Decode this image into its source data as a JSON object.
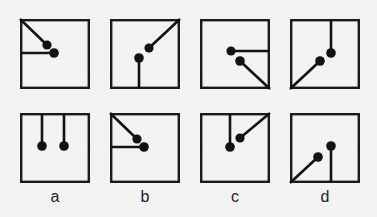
{
  "figure": {
    "title": "",
    "background_color": "#f4f3f1",
    "ink_color": "#121212",
    "columns": 4,
    "rows": 2,
    "cell_size_px": 70,
    "column_labels": [
      "a",
      "b",
      "c",
      "d"
    ]
  },
  "cells": [
    {
      "id": "top-a",
      "row": 0,
      "column": 0,
      "column_label": "a",
      "description": "diagonal from top-left corner to dot, plus horizontal from left edge to dot",
      "segments": [
        {
          "name": "diagonal-from-top-left-corner",
          "x1": 0,
          "y1": 0,
          "x2": 27,
          "y2": 26,
          "dot_x": 27,
          "dot_y": 26,
          "dot_r": 4.6
        },
        {
          "name": "horizontal-from-left-edge",
          "x1": 0,
          "y1": 34,
          "x2": 34,
          "y2": 34,
          "dot_x": 34,
          "dot_y": 34,
          "dot_r": 4.8
        }
      ]
    },
    {
      "id": "top-b",
      "row": 0,
      "column": 1,
      "column_label": "b",
      "description": "diagonal from top-right corner to dot, plus vertical from bottom edge to dot",
      "segments": [
        {
          "name": "diagonal-from-top-right-corner",
          "x1": 70,
          "y1": 0,
          "x2": 39,
          "y2": 29,
          "dot_x": 39,
          "dot_y": 29,
          "dot_r": 4.6
        },
        {
          "name": "vertical-from-bottom-edge",
          "x1": 29,
          "y1": 70,
          "x2": 29,
          "y2": 39,
          "dot_x": 29,
          "dot_y": 39,
          "dot_r": 4.8
        }
      ]
    },
    {
      "id": "top-c",
      "row": 0,
      "column": 2,
      "column_label": "c",
      "description": "horizontal from right edge to dot, plus diagonal from bottom-right corner to dot",
      "segments": [
        {
          "name": "horizontal-from-right-edge",
          "x1": 70,
          "y1": 32,
          "x2": 31,
          "y2": 32,
          "dot_x": 31,
          "dot_y": 32,
          "dot_r": 4.6
        },
        {
          "name": "diagonal-from-bottom-right-corner",
          "x1": 70,
          "y1": 70,
          "x2": 40,
          "y2": 42,
          "dot_x": 40,
          "dot_y": 42,
          "dot_r": 4.8
        }
      ]
    },
    {
      "id": "top-d",
      "row": 0,
      "column": 3,
      "column_label": "d",
      "description": "vertical from top edge to dot, plus diagonal from bottom-left corner to dot",
      "segments": [
        {
          "name": "vertical-from-top-edge",
          "x1": 41,
          "y1": 0,
          "x2": 41,
          "y2": 34,
          "dot_x": 41,
          "dot_y": 34,
          "dot_r": 4.8
        },
        {
          "name": "diagonal-from-bottom-left-corner",
          "x1": 0,
          "y1": 70,
          "x2": 30,
          "y2": 42,
          "dot_x": 30,
          "dot_y": 42,
          "dot_r": 4.8
        }
      ]
    },
    {
      "id": "bottom-a",
      "row": 1,
      "column": 0,
      "column_label": "a",
      "description": "two vertical lines from top edge, each ending in a dot",
      "segments": [
        {
          "name": "vertical-left-from-top-edge",
          "x1": 22,
          "y1": 0,
          "x2": 22,
          "y2": 33,
          "dot_x": 22,
          "dot_y": 33,
          "dot_r": 4.8
        },
        {
          "name": "vertical-right-from-top-edge",
          "x1": 44,
          "y1": 0,
          "x2": 44,
          "y2": 33,
          "dot_x": 44,
          "dot_y": 33,
          "dot_r": 4.8
        }
      ]
    },
    {
      "id": "bottom-b",
      "row": 1,
      "column": 1,
      "column_label": "b",
      "description": "diagonal from top-left corner to dot, plus horizontal from left edge to dot",
      "segments": [
        {
          "name": "diagonal-from-top-left-corner",
          "x1": 0,
          "y1": 0,
          "x2": 27,
          "y2": 26,
          "dot_x": 27,
          "dot_y": 26,
          "dot_r": 4.6
        },
        {
          "name": "horizontal-from-left-edge",
          "x1": 0,
          "y1": 34,
          "x2": 34,
          "y2": 34,
          "dot_x": 34,
          "dot_y": 34,
          "dot_r": 4.8
        }
      ]
    },
    {
      "id": "bottom-c",
      "row": 1,
      "column": 2,
      "column_label": "c",
      "description": "vertical from top edge to dot, plus diagonal from top-right corner to dot",
      "segments": [
        {
          "name": "vertical-from-top-edge",
          "x1": 30,
          "y1": 0,
          "x2": 30,
          "y2": 34,
          "dot_x": 30,
          "dot_y": 34,
          "dot_r": 4.8
        },
        {
          "name": "diagonal-from-top-right-corner",
          "x1": 70,
          "y1": 0,
          "x2": 40,
          "y2": 25,
          "dot_x": 40,
          "dot_y": 25,
          "dot_r": 4.6
        }
      ]
    },
    {
      "id": "bottom-d",
      "row": 1,
      "column": 3,
      "column_label": "d",
      "description": "diagonal from bottom-left corner to dot, plus vertical from bottom edge to dot",
      "segments": [
        {
          "name": "diagonal-from-bottom-left-corner",
          "x1": 0,
          "y1": 70,
          "x2": 28,
          "y2": 44,
          "dot_x": 28,
          "dot_y": 44,
          "dot_r": 4.8
        },
        {
          "name": "vertical-from-bottom-edge",
          "x1": 41,
          "y1": 70,
          "x2": 41,
          "y2": 33,
          "dot_x": 41,
          "dot_y": 33,
          "dot_r": 4.8
        }
      ]
    }
  ]
}
